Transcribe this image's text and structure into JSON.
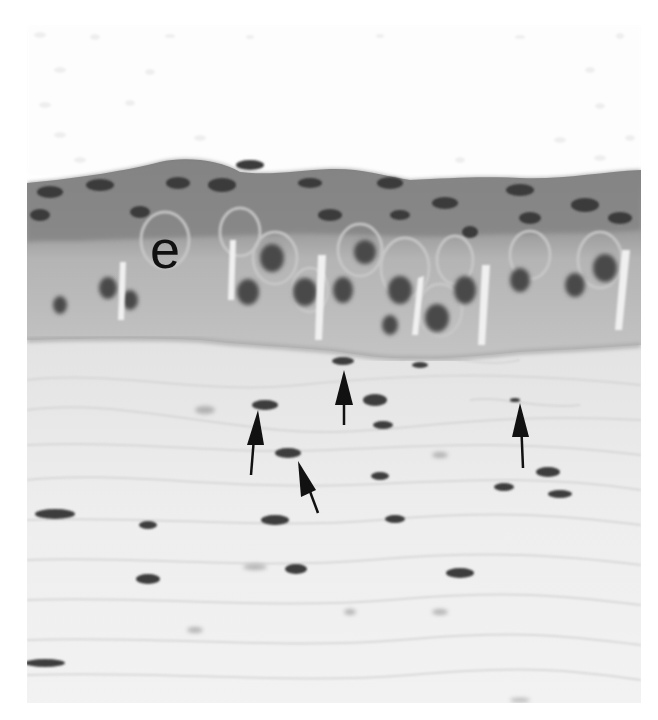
{
  "figure": {
    "type": "histology-micrograph",
    "stain": "grayscale",
    "panel_label": "e",
    "panel_label_meaning": "epithelium",
    "arrow_count": 5,
    "arrows": [
      {
        "tip_x": 258,
        "tip_y": 410,
        "tail_x": 251,
        "tail_y": 475,
        "direction": "up"
      },
      {
        "tip_x": 298,
        "tip_y": 461,
        "tail_x": 318,
        "tail_y": 513,
        "direction": "up-left"
      },
      {
        "tip_x": 344,
        "tip_y": 370,
        "tail_x": 344,
        "tail_y": 425,
        "direction": "up"
      },
      {
        "tip_x": 520,
        "tip_y": 403,
        "tail_x": 523,
        "tail_y": 468,
        "direction": "up"
      }
    ],
    "colors": {
      "background": "#ffffff",
      "epithelium_surface": "#8a8a8a",
      "epithelium_body": "#b8b8b8",
      "connective_tissue": "#ececec",
      "nuclei": "#3c3c3c",
      "arrow": "#111111"
    }
  }
}
